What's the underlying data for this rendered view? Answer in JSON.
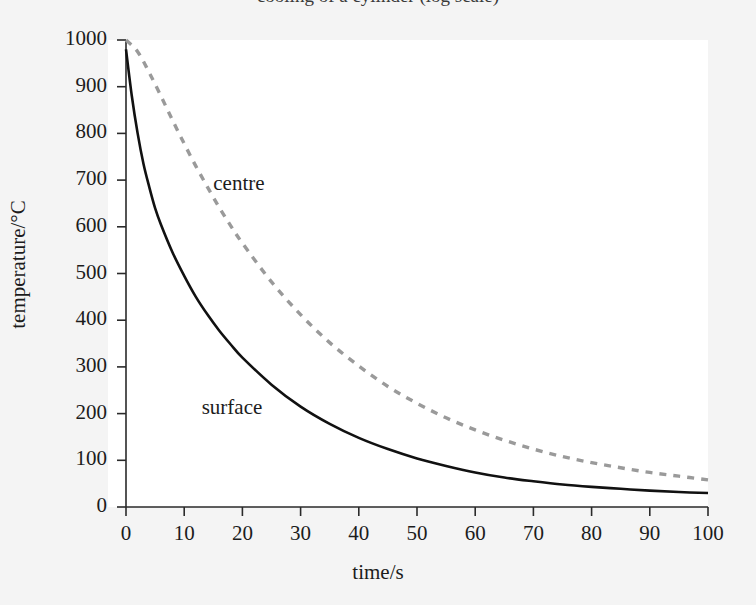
{
  "figure": {
    "title_cropped": "cooling of a cylinder (log scale)",
    "background_color": "#f4f4f4",
    "plot_background_color": "#ffffff"
  },
  "chart_data": {
    "type": "line",
    "title": "",
    "xlabel": "time/s",
    "ylabel": "temperature/°C",
    "xlim": [
      0,
      100
    ],
    "ylim": [
      0,
      1000
    ],
    "xticks": [
      0,
      10,
      20,
      30,
      40,
      50,
      60,
      70,
      80,
      90,
      100
    ],
    "yticks": [
      0,
      100,
      200,
      300,
      400,
      500,
      600,
      700,
      800,
      900,
      1000
    ],
    "grid": false,
    "legend": "inline-annotations",
    "series": [
      {
        "name": "surface",
        "style": "solid",
        "color": "#111111",
        "label_position": {
          "x": 13,
          "y": 210
        },
        "x": [
          0,
          1,
          2,
          3,
          4,
          5,
          6,
          8,
          10,
          12,
          14,
          16,
          18,
          20,
          25,
          30,
          35,
          40,
          45,
          50,
          55,
          60,
          65,
          70,
          75,
          80,
          85,
          90,
          95,
          100
        ],
        "y": [
          980,
          880,
          800,
          735,
          685,
          640,
          605,
          545,
          495,
          450,
          412,
          378,
          348,
          320,
          262,
          215,
          178,
          148,
          124,
          104,
          88,
          74,
          63,
          55,
          48,
          43,
          39,
          35,
          32,
          30
        ]
      },
      {
        "name": "centre",
        "style": "dashed",
        "color": "#9a9a9a",
        "label_position": {
          "x": 15,
          "y": 690
        },
        "x": [
          0,
          2,
          4,
          6,
          8,
          10,
          12,
          14,
          16,
          18,
          20,
          25,
          30,
          35,
          40,
          45,
          50,
          55,
          60,
          65,
          70,
          75,
          80,
          85,
          90,
          95,
          100
        ],
        "y": [
          1000,
          975,
          930,
          880,
          828,
          778,
          730,
          685,
          642,
          602,
          565,
          482,
          412,
          352,
          302,
          258,
          222,
          191,
          165,
          143,
          124,
          108,
          95,
          84,
          74,
          66,
          58
        ]
      }
    ]
  },
  "axis_labels": {
    "x_title": "time/s",
    "y_title": "temperature/°C"
  },
  "annotations": [
    {
      "name": "centre",
      "text": "centre"
    },
    {
      "name": "surface",
      "text": "surface"
    }
  ]
}
